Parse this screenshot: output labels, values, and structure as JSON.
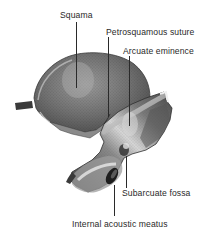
{
  "figure": {
    "colors": {
      "bone_dark": "#4a4a4a",
      "bone_mid": "#7b7b7b",
      "bone_light": "#b8b8b8",
      "highlight": "#e4e4e4",
      "ink": "#2a2a2a"
    },
    "labels": [
      {
        "id": "squama",
        "text": "Squama"
      },
      {
        "id": "petrosquamous-suture",
        "text": "Petrosquamous suture"
      },
      {
        "id": "arcuate-eminence",
        "text": "Arcuate eminence"
      },
      {
        "id": "subarcuate-fossa",
        "text": "Subarcuate fossa"
      },
      {
        "id": "internal-acoustic-meatus",
        "text": "Internal acoustic meatus"
      }
    ]
  }
}
